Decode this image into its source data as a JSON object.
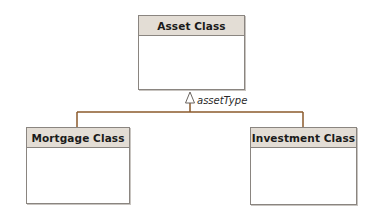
{
  "diagram": {
    "type": "uml-class-diagram",
    "classes": [
      {
        "id": "asset",
        "name": "Asset Class",
        "role": "superclass"
      },
      {
        "id": "mortgage",
        "name": "Mortgage Class",
        "role": "subclass"
      },
      {
        "id": "investment",
        "name": "Investment Class",
        "role": "subclass"
      }
    ],
    "generalization": {
      "label": "assetType",
      "parent": "asset",
      "children": [
        "mortgage",
        "investment"
      ]
    },
    "colors": {
      "connector": "#8b5a2b",
      "header_fill": "#e3ddd5",
      "border": "#8a8580"
    }
  }
}
